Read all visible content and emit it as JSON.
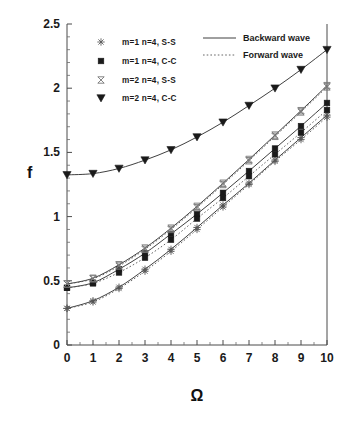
{
  "chart_data": {
    "type": "line",
    "title": "",
    "xlabel": "Ω",
    "ylabel": "f",
    "xlim": [
      0,
      10
    ],
    "ylim": [
      0,
      2.5
    ],
    "xticks": [
      0,
      1,
      2,
      3,
      4,
      5,
      6,
      7,
      8,
      9,
      10
    ],
    "xtick_labels": [
      "0",
      "1",
      "2",
      "3",
      "4",
      "5",
      "6",
      "7",
      "8",
      "9",
      "10"
    ],
    "yticks": [
      0,
      0.5,
      1,
      1.5,
      2,
      2.5
    ],
    "ytick_labels": [
      "0",
      "0.5",
      "1",
      "1.5",
      "2",
      "2.5"
    ],
    "grid": false,
    "minor_ticks": true,
    "legend_position": "upper-left",
    "x": [
      0,
      1,
      2,
      3,
      4,
      5,
      6,
      7,
      8,
      9,
      10
    ],
    "series": [
      {
        "name": "m=1  n=4,  S-S  Backward wave",
        "marker": "star",
        "line": "solid",
        "wave": "backward",
        "values": [
          0.285,
          0.345,
          0.45,
          0.59,
          0.745,
          0.915,
          1.09,
          1.26,
          1.44,
          1.615,
          1.79
        ]
      },
      {
        "name": "m=1  n=4,  S-S  Forward wave",
        "marker": "star",
        "line": "dashed",
        "wave": "forward",
        "values": [
          0.285,
          0.335,
          0.44,
          0.575,
          0.73,
          0.9,
          1.075,
          1.25,
          1.43,
          1.6,
          1.775
        ]
      },
      {
        "name": "m=1  n=4,  C-C  Backward wave",
        "marker": "square",
        "line": "solid",
        "wave": "backward",
        "values": [
          0.445,
          0.485,
          0.59,
          0.715,
          0.865,
          1.02,
          1.185,
          1.355,
          1.53,
          1.705,
          1.885
        ]
      },
      {
        "name": "m=1  n=4,  C-C  Forward wave",
        "marker": "square",
        "line": "dashed",
        "wave": "forward",
        "values": [
          0.445,
          0.48,
          0.565,
          0.68,
          0.82,
          0.985,
          1.145,
          1.315,
          1.485,
          1.655,
          1.83
        ]
      },
      {
        "name": "m=2  n=4,  S-S  Backward wave",
        "marker": "bowtie",
        "line": "solid",
        "wave": "backward",
        "values": [
          0.475,
          0.52,
          0.625,
          0.755,
          0.91,
          1.08,
          1.26,
          1.445,
          1.635,
          1.825,
          2.02
        ]
      },
      {
        "name": "m=2  n=4,  S-S  Forward wave",
        "marker": "bowtie",
        "line": "dashed",
        "wave": "forward",
        "values": [
          0.475,
          0.515,
          0.615,
          0.745,
          0.9,
          1.07,
          1.25,
          1.435,
          1.625,
          1.815,
          2.01
        ]
      },
      {
        "name": "m=2  n=4,  C-C  Backward wave",
        "marker": "triangle-down",
        "line": "solid",
        "wave": "backward",
        "values": [
          1.325,
          1.335,
          1.375,
          1.44,
          1.52,
          1.62,
          1.735,
          1.865,
          2.0,
          2.145,
          2.3
        ]
      }
    ]
  },
  "legend": {
    "markers": [
      {
        "icon": "star-marker-icon",
        "label": "m=1  n=4,  S-S"
      },
      {
        "icon": "filled-square-marker-icon",
        "label": "m=1  n=4,  C-C"
      },
      {
        "icon": "bowtie-marker-icon",
        "label": "m=2  n=4,  S-S"
      },
      {
        "icon": "filled-triangle-down-marker-icon",
        "label": "m=2  n=4,  C-C"
      }
    ],
    "lines": [
      {
        "icon": "solid-line-icon",
        "label": "Backward wave"
      },
      {
        "icon": "dashed-line-icon",
        "label": "Forward wave"
      }
    ]
  },
  "axes": {
    "y_title": "f",
    "x_title": "Ω",
    "y_labels": [
      "2.5",
      "2",
      "1.5",
      "1",
      "0.5",
      "0"
    ],
    "x_labels": [
      "0",
      "1",
      "2",
      "3",
      "4",
      "5",
      "6",
      "7",
      "8",
      "9",
      "10"
    ]
  },
  "colors": {
    "background": "#ffffff",
    "axis": "#4a4a4a",
    "curve_solid": "#2a2a2a",
    "curve_dashed": "#555555",
    "text": "#1a1a1a"
  }
}
